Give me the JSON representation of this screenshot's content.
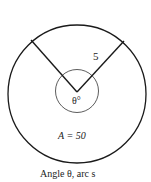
{
  "diagram": {
    "radius_label": "5",
    "angle_label": "θ°",
    "area_label": "A = 50",
    "caption": "Angle θ, arc s",
    "stroke_color": "#1a1a1a"
  }
}
